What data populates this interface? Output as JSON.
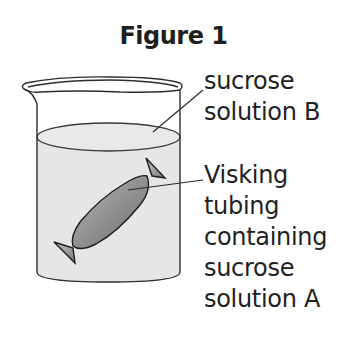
{
  "figure": {
    "title": "Figure 1"
  },
  "labels": {
    "solution_b": [
      "sucrose",
      "solution B"
    ],
    "tubing": [
      "Visking",
      "tubing",
      "containing",
      "sucrose",
      "solution A"
    ]
  },
  "colors": {
    "outline": "#2a2a2a",
    "liquid": "#e6e6e6",
    "tubing_dark": "#6e6e6e",
    "tubing_light": "#b4b4b4",
    "text": "#222222"
  }
}
